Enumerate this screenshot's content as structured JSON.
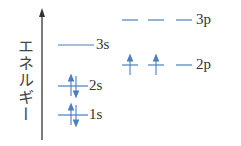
{
  "axis": {
    "label": "エネルギー"
  },
  "levels": {
    "l3p": "3p",
    "l2p": "2p",
    "l3s": "3s",
    "l2s": "2s",
    "l1s": "1s"
  },
  "colors": {
    "line": "#4a7fc1",
    "axis": "#333333"
  },
  "electrons": {
    "1s": 2,
    "2s": 2,
    "2p": 2,
    "3s": 0,
    "3p": 0
  }
}
